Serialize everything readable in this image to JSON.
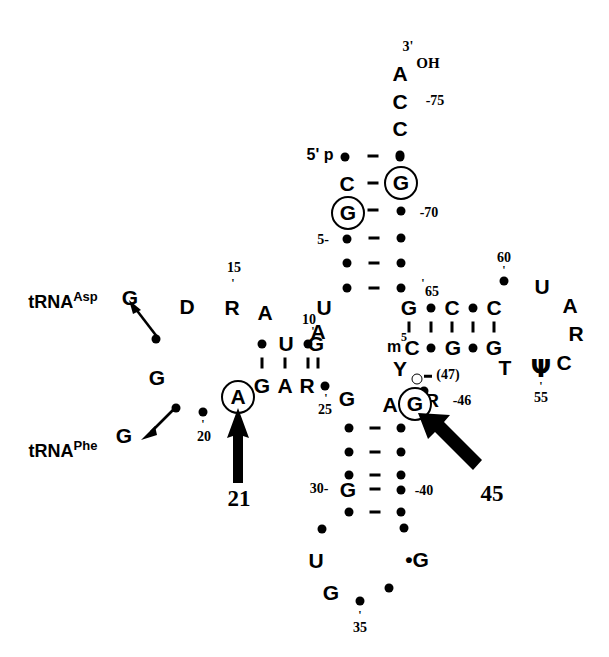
{
  "figure": {
    "type": "tRNA cloverleaf secondary structure diagram",
    "title": "",
    "strand_terminus_labels": {
      "five_prime": "5' p",
      "three_prime_end": "A",
      "three_prime_mark": "3'",
      "hydroxyl": "OH"
    }
  },
  "acceptor_stem": {
    "top_bases": [
      {
        "label": "A",
        "x": 402,
        "y": 70
      },
      {
        "label": "C",
        "x": 402,
        "y": 100
      },
      {
        "label": "C",
        "x": 402,
        "y": 127
      }
    ],
    "three_prime_tag": "3'",
    "oh_tag": "OH",
    "c75_number": "-75",
    "left_column": [
      "5' p",
      "C",
      "dot",
      "G",
      "dot",
      "dot",
      "dot"
    ],
    "right_column": [
      "dot",
      "G",
      "dot",
      "dot",
      "dot",
      "dot",
      "dot"
    ],
    "numbers": [
      "-75",
      "-70",
      "5-",
      "65"
    ]
  },
  "d_arm": {
    "loop_bases": [
      "G",
      "D",
      "R",
      "A",
      "G"
    ],
    "stem_top": [
      "dot",
      "U",
      "dot",
      "G"
    ],
    "stem_bottom": [
      "G",
      "A",
      "R",
      "dot"
    ],
    "numbers": [
      "15",
      "10",
      "20",
      "25"
    ],
    "circled_base": "A"
  },
  "anticodon_arm": {
    "stem_left": [
      "dot",
      "dot",
      "dot",
      "G",
      "dot"
    ],
    "stem_right": [
      "dot",
      "dot",
      "dot",
      "dot",
      "dot"
    ],
    "loop_bases": [
      "dot",
      "U",
      "G",
      "dot",
      "G",
      "dot",
      "dot"
    ],
    "numbers": [
      "30-",
      "-40",
      "35"
    ],
    "modified_g": "*G"
  },
  "variable_loop": {
    "bases": [
      "Y",
      "R"
    ],
    "numbers": [
      "(47)",
      "-46"
    ],
    "circled_base": "G",
    "adjacent_base": "A"
  },
  "t_arm": {
    "stem_top": [
      "G",
      "dot",
      "C",
      "dot",
      "C"
    ],
    "stem_bottom": [
      "m5C",
      "dot",
      "G",
      "dot",
      "G"
    ],
    "loop_bases": [
      "U",
      "A",
      "R",
      "C",
      "psi",
      "T"
    ],
    "numbers": [
      "65",
      "60",
      "55",
      "5"
    ],
    "m5c_superscript": "5",
    "m5c_prefix": "m",
    "m5c_base": "C"
  },
  "annotations": {
    "trna_asp": "tRNA",
    "trna_asp_sup": "Asp",
    "trna_phe": "tRNA",
    "trna_phe_sup": "Phe",
    "arrow_21": "21",
    "arrow_45": "45"
  },
  "bases": {
    "U": "U",
    "A": "A",
    "G": "G",
    "C": "C",
    "D": "D",
    "R": "R",
    "Y": "Y",
    "T": "T",
    "psi": "Ψ",
    "star_g": "•G"
  },
  "colors": {
    "ink": "#000000",
    "background": "#ffffff"
  }
}
